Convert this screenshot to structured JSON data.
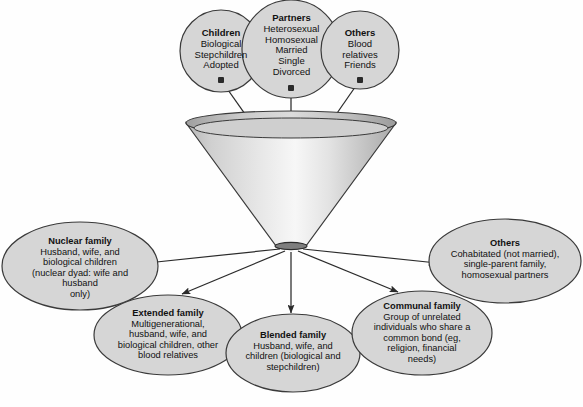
{
  "diagram": {
    "colors": {
      "node_fill": "#d6d6d6",
      "node_stroke": "#3a3a3a",
      "cone_light": "#fbfbfb",
      "cone_mid": "#d2d2d2",
      "cone_dark": "#9a9a9a",
      "line": "#2b2b2b",
      "background": "#fefefe",
      "text": "#111111"
    },
    "inputs": [
      {
        "id": "children",
        "title": "Children",
        "lines": [
          "Biological",
          "Stepchildren",
          "Adopted"
        ]
      },
      {
        "id": "partners",
        "title": "Partners",
        "lines": [
          "Heterosexual",
          "Homosexual",
          "Married",
          "Single",
          "Divorced"
        ]
      },
      {
        "id": "others-top",
        "title": "Others",
        "lines": [
          "Blood",
          "relatives",
          "Friends"
        ]
      }
    ],
    "funnel": {
      "label": "funnel"
    },
    "outputs": [
      {
        "id": "nuclear-family",
        "title": "Nuclear family",
        "lines": [
          "Husband, wife, and",
          "biological children",
          "(nuclear dyad: wife and",
          "husband",
          "only)"
        ]
      },
      {
        "id": "extended-family",
        "title": "Extended family",
        "lines": [
          "Multigenerational,",
          "husband, wife, and",
          "biological children, other",
          "blood relatives"
        ]
      },
      {
        "id": "blended-family",
        "title": "Blended family",
        "lines": [
          "Husband, wife, and",
          "children (biological and",
          "stepchildren)"
        ]
      },
      {
        "id": "communal-family",
        "title": "Communal family",
        "lines": [
          "Group of unrelated",
          "individuals who share a",
          "common bond (eg,",
          "religion, financial",
          "needs)"
        ]
      },
      {
        "id": "others-bottom",
        "title": "Others",
        "lines": [
          "Cohabitated (not married),",
          "single-parent family,",
          "homosexual partners"
        ]
      }
    ]
  }
}
